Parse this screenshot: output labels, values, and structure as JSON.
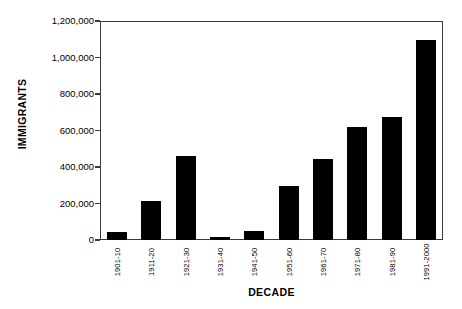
{
  "chart_data": {
    "type": "bar",
    "title": "",
    "xlabel": "DECADE",
    "ylabel": "IMMIGRANTS",
    "categories": [
      "1901-10",
      "1911-20",
      "1921-30",
      "1931-40",
      "1941-50",
      "1951-60",
      "1961-70",
      "1971-80",
      "1981-90",
      "1991-2000"
    ],
    "values": [
      45000,
      215000,
      460000,
      15000,
      50000,
      295000,
      445000,
      620000,
      675000,
      1095000
    ],
    "ylim": [
      0,
      1200000
    ],
    "ytick_values": [
      0,
      200000,
      400000,
      600000,
      800000,
      1000000,
      1200000
    ],
    "ytick_labels": [
      "0",
      "200,000",
      "400,000",
      "600,000",
      "800,000",
      "1,000,000",
      "1,200,000"
    ],
    "grid": false,
    "legend": null,
    "bar_color": "#000000",
    "frame_color": "#3a3a3a",
    "background_color": "#ffffff"
  }
}
